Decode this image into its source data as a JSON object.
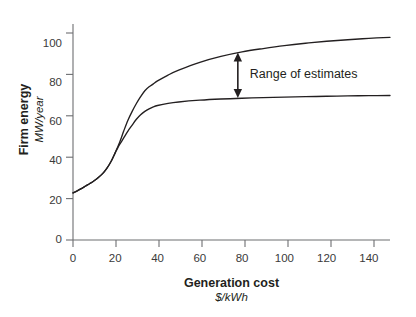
{
  "chart_data": {
    "type": "line",
    "title": "",
    "xlabel": "Generation cost",
    "xunits": "$/kWh",
    "ylabel": "Firm energy",
    "yunits": "MW/year",
    "xlim": [
      0,
      150
    ],
    "ylim": [
      0,
      110
    ],
    "xticks": [
      0,
      20,
      40,
      60,
      80,
      100,
      120,
      140
    ],
    "yticks": [
      0,
      20,
      40,
      60,
      80,
      100
    ],
    "xtick_labels": [
      "0",
      "20",
      "40",
      "60",
      "80",
      "100",
      "120",
      "140"
    ],
    "ytick_labels": [
      "0",
      "20",
      "40",
      "60",
      "80",
      "100"
    ],
    "grid": false,
    "legend": false,
    "series": [
      {
        "name": "upper-estimate",
        "points": [
          [
            0,
            24.0
          ],
          [
            2,
            25.0
          ],
          [
            4,
            26.2
          ],
          [
            6,
            27.5
          ],
          [
            8,
            28.8
          ],
          [
            10,
            30.2
          ],
          [
            12,
            31.8
          ],
          [
            14,
            33.8
          ],
          [
            16,
            36.5
          ],
          [
            18,
            40.0
          ],
          [
            20,
            44.5
          ],
          [
            21,
            47.0
          ],
          [
            22,
            49.5
          ],
          [
            23,
            52.5
          ],
          [
            24,
            55.5
          ],
          [
            26,
            61.0
          ],
          [
            28,
            65.5
          ],
          [
            30,
            69.5
          ],
          [
            32,
            73.0
          ],
          [
            34,
            76.0
          ],
          [
            36,
            78.0
          ],
          [
            38,
            79.5
          ],
          [
            40,
            81.0
          ],
          [
            45,
            84.0
          ],
          [
            50,
            86.5
          ],
          [
            60,
            90.5
          ],
          [
            70,
            93.5
          ],
          [
            80,
            95.8
          ],
          [
            90,
            97.5
          ],
          [
            100,
            99.0
          ],
          [
            110,
            100.2
          ],
          [
            120,
            101.2
          ],
          [
            130,
            102.0
          ],
          [
            140,
            102.7
          ],
          [
            150,
            103.2
          ]
        ]
      },
      {
        "name": "lower-estimate",
        "points": [
          [
            0,
            24.0
          ],
          [
            2,
            25.0
          ],
          [
            4,
            26.2
          ],
          [
            6,
            27.5
          ],
          [
            8,
            28.8
          ],
          [
            10,
            30.2
          ],
          [
            12,
            31.8
          ],
          [
            14,
            33.8
          ],
          [
            16,
            36.5
          ],
          [
            18,
            40.0
          ],
          [
            20,
            44.5
          ],
          [
            21,
            46.5
          ],
          [
            22,
            48.5
          ],
          [
            24,
            52.0
          ],
          [
            26,
            55.5
          ],
          [
            28,
            58.5
          ],
          [
            30,
            61.5
          ],
          [
            32,
            63.8
          ],
          [
            34,
            65.5
          ],
          [
            36,
            66.8
          ],
          [
            38,
            67.8
          ],
          [
            40,
            68.5
          ],
          [
            45,
            69.6
          ],
          [
            50,
            70.3
          ],
          [
            60,
            71.2
          ],
          [
            70,
            71.8
          ],
          [
            80,
            72.2
          ],
          [
            90,
            72.5
          ],
          [
            100,
            72.8
          ],
          [
            110,
            73.0
          ],
          [
            120,
            73.2
          ],
          [
            130,
            73.4
          ],
          [
            140,
            73.5
          ],
          [
            150,
            73.6
          ]
        ]
      }
    ],
    "annotations": [
      {
        "name": "range-of-estimates",
        "label": "Range of estimates",
        "type": "double-arrow",
        "x": 78,
        "y_top": 95.5,
        "y_bottom": 72.3
      }
    ]
  },
  "axis_color": "#6d6e71",
  "curve_color": "#231f20",
  "text_color": "#231f20"
}
